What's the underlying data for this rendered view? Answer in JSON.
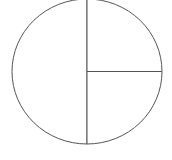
{
  "chart_data": {
    "type": "pie",
    "title": "",
    "categories": [
      "Left half",
      "Top-right quarter",
      "Bottom-right quarter"
    ],
    "values": [
      50,
      25,
      25
    ],
    "labels_visible": false,
    "legend": "none",
    "colors": {
      "fill": "#ffffff",
      "stroke": "#555555"
    }
  },
  "geometry": {
    "cx": 87,
    "cy": 71.5,
    "rx": 75,
    "ry": 72.5
  }
}
